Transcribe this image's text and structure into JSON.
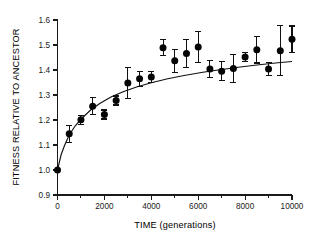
{
  "chart_data": {
    "type": "scatter",
    "title": "",
    "xlabel": "TIME (generations)",
    "ylabel": "FITNESS RELATIVE TO ANCESTOR",
    "xlim": [
      0,
      10000
    ],
    "ylim": [
      0.9,
      1.6
    ],
    "xticks": [
      0,
      2000,
      4000,
      6000,
      8000,
      10000
    ],
    "xtick_labels": [
      "0",
      "2000",
      "4000",
      "6000",
      "8000",
      "10000"
    ],
    "xminor_ticks": [
      1000,
      3000,
      5000,
      7000,
      9000
    ],
    "yticks": [
      0.9,
      1.0,
      1.1,
      1.2,
      1.3,
      1.4,
      1.5,
      1.6
    ],
    "ytick_labels": [
      "0.9",
      "1.0",
      "1.1",
      "1.2",
      "1.3",
      "1.4",
      "1.5",
      "1.6"
    ],
    "grid": false,
    "legend": "none",
    "marker_color": "#050505",
    "curve_color": "#111111",
    "x": [
      0,
      500,
      1000,
      1500,
      2000,
      2500,
      3000,
      3500,
      4000,
      4500,
      5000,
      5500,
      6000,
      6500,
      7000,
      7500,
      8000,
      8500,
      9000,
      9500,
      10000
    ],
    "values": [
      1.0,
      1.145,
      1.201,
      1.255,
      1.222,
      1.278,
      1.348,
      1.365,
      1.372,
      1.489,
      1.437,
      1.466,
      1.492,
      1.404,
      1.395,
      1.406,
      1.452,
      1.481,
      1.404,
      1.477,
      1.523
    ],
    "error_low": [
      0.0,
      0.035,
      0.018,
      0.034,
      0.018,
      0.018,
      0.063,
      0.03,
      0.022,
      0.032,
      0.046,
      0.055,
      0.062,
      0.035,
      0.038,
      0.056,
      0.017,
      0.053,
      0.026,
      0.1,
      0.053
    ],
    "error_high": [
      0.0,
      0.034,
      0.018,
      0.034,
      0.018,
      0.018,
      0.063,
      0.03,
      0.022,
      0.032,
      0.046,
      0.055,
      0.062,
      0.035,
      0.038,
      0.056,
      0.017,
      0.053,
      0.026,
      0.1,
      0.053
    ],
    "fit_curve": {
      "description": "hyperbolic fitness trajectory",
      "x": [
        0,
        150,
        300,
        500,
        750,
        1000,
        1400,
        1800,
        2300,
        2800,
        3400,
        4000,
        4700,
        5400,
        6200,
        7000,
        7800,
        8600,
        9400,
        10000
      ],
      "y": [
        1.0,
        1.06,
        1.098,
        1.14,
        1.176,
        1.203,
        1.239,
        1.266,
        1.293,
        1.313,
        1.333,
        1.349,
        1.365,
        1.378,
        1.391,
        1.402,
        1.412,
        1.421,
        1.429,
        1.434
      ]
    }
  }
}
